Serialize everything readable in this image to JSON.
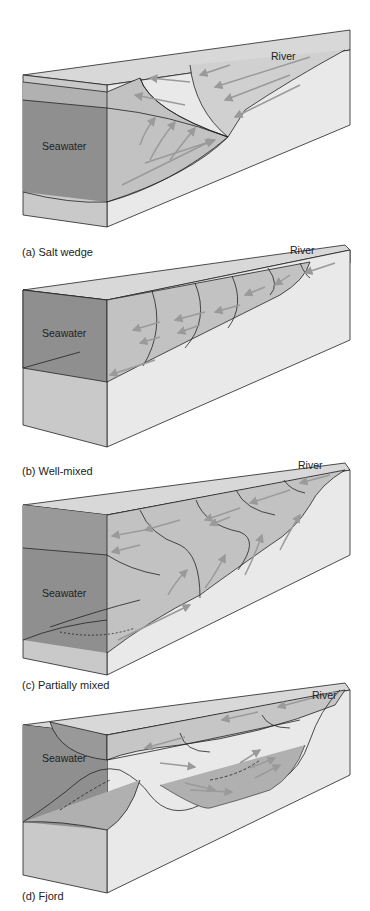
{
  "figure": {
    "panels": [
      {
        "id": "a",
        "caption": "(a) Salt wedge",
        "sea_label": "Seawater",
        "river_label": "River"
      },
      {
        "id": "b",
        "caption": "(b) Well-mixed",
        "sea_label": "Seawater",
        "river_label": "River"
      },
      {
        "id": "c",
        "caption": "(c) Partially mixed",
        "sea_label": "Seawater",
        "river_label": "River"
      },
      {
        "id": "d",
        "caption": "(d) Fjord",
        "sea_label": "Seawater",
        "river_label": "River"
      }
    ],
    "colors": {
      "seawater_dark": "#8f8f8f",
      "seawater_mid": "#a9a9a9",
      "water_light": "#c4c4c4",
      "top_face": "#d6d6d6",
      "ground": "#e8e8e8",
      "line": "#222222",
      "arrow": "#9a9a9a"
    }
  }
}
